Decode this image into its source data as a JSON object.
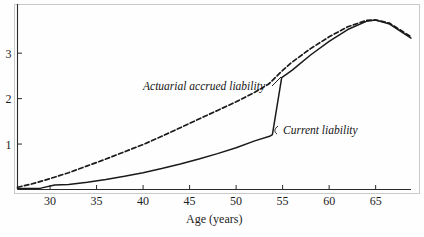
{
  "chart_data": {
    "type": "line",
    "title": "",
    "xlabel": "Age (years)",
    "ylabel": "",
    "xlim": [
      26.5,
      68.8
    ],
    "ylim": [
      0,
      3.95
    ],
    "xticks": [
      30,
      35,
      40,
      45,
      50,
      55,
      60,
      65
    ],
    "xtick_labels": [
      "30",
      "35",
      "40",
      "45",
      "50",
      "55",
      "60",
      "65"
    ],
    "yticks": [
      1,
      2,
      3
    ],
    "ytick_labels": [
      "1",
      "2",
      "3"
    ],
    "grid": false,
    "legend_position": "inline-annotations",
    "series": [
      {
        "name": "Actuarial accrued liability",
        "style": "dashed",
        "color": "#1a1a1a",
        "x": [
          26.5,
          28,
          30,
          32,
          34,
          36,
          38,
          40,
          42,
          44,
          46,
          48,
          50,
          52,
          53.5,
          54.5,
          55,
          56,
          58,
          60,
          62,
          64,
          65,
          66.5,
          68.8
        ],
        "y": [
          0.05,
          0.12,
          0.24,
          0.37,
          0.52,
          0.67,
          0.83,
          0.99,
          1.17,
          1.36,
          1.55,
          1.74,
          1.93,
          2.14,
          2.32,
          2.52,
          2.62,
          2.8,
          3.1,
          3.36,
          3.58,
          3.72,
          3.73,
          3.66,
          3.36
        ]
      },
      {
        "name": "Current liability",
        "style": "solid",
        "color": "#1a1a1a",
        "x": [
          26.5,
          29,
          30.5,
          32,
          34,
          36,
          38,
          40,
          42,
          44,
          46,
          48,
          50,
          52,
          53.6,
          53.9,
          54.9,
          56,
          58,
          60,
          62,
          64,
          65,
          66.5,
          68.8
        ],
        "y": [
          0.02,
          0.03,
          0.1,
          0.11,
          0.16,
          0.22,
          0.29,
          0.37,
          0.46,
          0.56,
          0.67,
          0.79,
          0.92,
          1.07,
          1.17,
          1.21,
          2.46,
          2.62,
          2.96,
          3.26,
          3.52,
          3.7,
          3.73,
          3.64,
          3.33
        ]
      }
    ],
    "annotations": [
      {
        "text": "Actuarial accrued liability",
        "x_px": 143,
        "y_px": 90,
        "anchor": "start"
      },
      {
        "text": "Current liability",
        "x_px": 283,
        "y_px": 134,
        "anchor": "start"
      }
    ]
  },
  "axis": {
    "x_title": "Age (years)"
  }
}
